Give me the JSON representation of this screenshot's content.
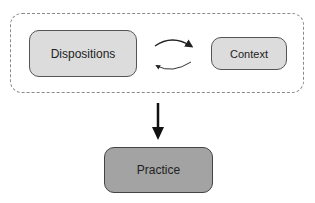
{
  "diagram": {
    "container": {
      "style": "dashed",
      "border_color": "#8a8a8a"
    },
    "nodes": [
      {
        "id": "dispositions",
        "label": "Dispositions",
        "fill": "#dcdcdc"
      },
      {
        "id": "context",
        "label": "Context",
        "fill": "#dcdcdc"
      },
      {
        "id": "practice",
        "label": "Practice",
        "fill": "#a3a3a3"
      }
    ],
    "edges": [
      {
        "from": "dispositions",
        "to": "context",
        "type": "curved-arrow"
      },
      {
        "from": "context",
        "to": "dispositions",
        "type": "curved-arrow"
      },
      {
        "from": "container",
        "to": "practice",
        "type": "solid-arrow"
      }
    ]
  }
}
